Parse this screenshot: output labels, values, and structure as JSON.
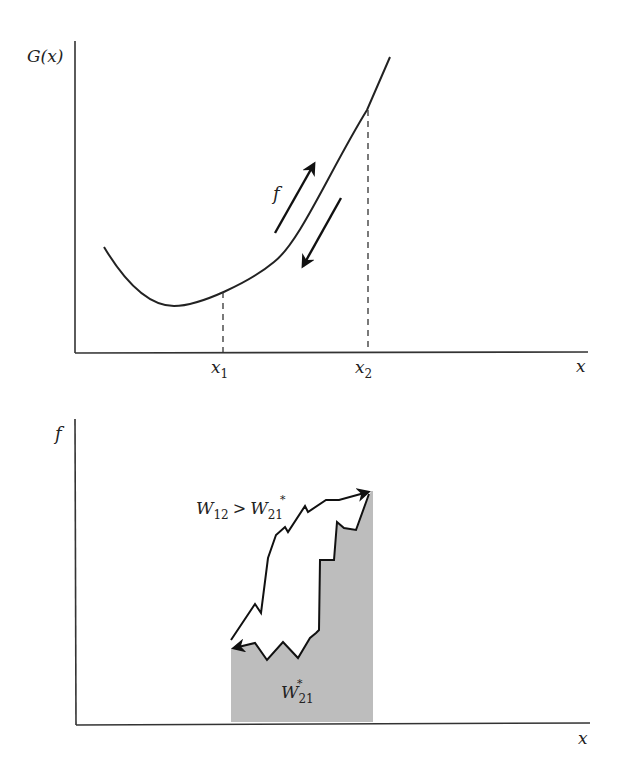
{
  "top_panel": {
    "y_axis_label": "G(x)",
    "x_axis_label": "x",
    "marker_1": {
      "base": "x",
      "sub": "1"
    },
    "marker_2": {
      "base": "x",
      "sub": "2"
    },
    "force_label": "f",
    "curve_color": "#222222"
  },
  "bottom_panel": {
    "y_axis_label": "f",
    "x_axis_label": "x",
    "work_forward": {
      "base": "W",
      "sub": "12",
      "relation": ">",
      "rhs_base": "W",
      "rhs_sub": "21",
      "rhs_sup": "*"
    },
    "work_reverse": {
      "base": "W",
      "sub": "21",
      "sup": "*"
    },
    "shade_color": "#bdbdbd"
  }
}
